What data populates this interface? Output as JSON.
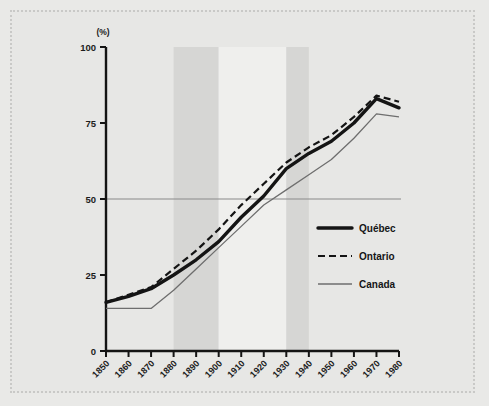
{
  "figure": {
    "background_color": "#e8e8e6",
    "frame_color": "#c9c9c7",
    "unit_label": "(%)"
  },
  "chart_data": {
    "type": "line",
    "title": "",
    "subtitle": "",
    "xlabel": "",
    "ylabel": "(%)",
    "xlim": [
      1850,
      1980
    ],
    "ylim": [
      0,
      100
    ],
    "grid": false,
    "legend_position": "center-right",
    "x": [
      1850,
      1860,
      1870,
      1880,
      1890,
      1900,
      1910,
      1920,
      1930,
      1940,
      1950,
      1960,
      1970,
      1980
    ],
    "xticklabels": [
      "1850",
      "1860",
      "1870",
      "1880",
      "1890",
      "1900",
      "1910",
      "1920",
      "1930",
      "1940",
      "1950",
      "1960",
      "1970",
      "1980"
    ],
    "yticks": [
      0,
      25,
      50,
      75,
      100
    ],
    "yticklabels": [
      "0",
      "25",
      "50",
      "75",
      "100"
    ],
    "reference_line": {
      "value": 50,
      "color": "#8a8a8a"
    },
    "shaded_bands": [
      {
        "from": 1880,
        "to": 1900,
        "color": "#d6d6d4"
      },
      {
        "from": 1900,
        "to": 1930,
        "color": "#efefed"
      },
      {
        "from": 1930,
        "to": 1940,
        "color": "#d6d6d4"
      }
    ],
    "series": [
      {
        "name": "Québec",
        "style": "solid-thick",
        "color": "#141414",
        "values": [
          16,
          18,
          20.5,
          25,
          30,
          36,
          44,
          51,
          60,
          65,
          69,
          75,
          83,
          80
        ]
      },
      {
        "name": "Ontario",
        "style": "dashed",
        "color": "#141414",
        "values": [
          16,
          18.5,
          21,
          27,
          33,
          40,
          48,
          55,
          62,
          67,
          71,
          77,
          84,
          82
        ]
      },
      {
        "name": "Canada",
        "style": "solid-thin",
        "color": "#6e6e6e",
        "values": [
          14,
          14,
          14,
          20,
          27,
          34,
          41,
          48,
          53,
          58,
          63,
          70,
          78,
          77
        ]
      }
    ]
  },
  "legend": {
    "items": [
      {
        "label": "Québec",
        "style": "solid-thick",
        "color": "#141414"
      },
      {
        "label": "Ontario",
        "style": "dashed",
        "color": "#141414"
      },
      {
        "label": "Canada",
        "style": "solid-thin",
        "color": "#6e6e6e"
      }
    ]
  }
}
